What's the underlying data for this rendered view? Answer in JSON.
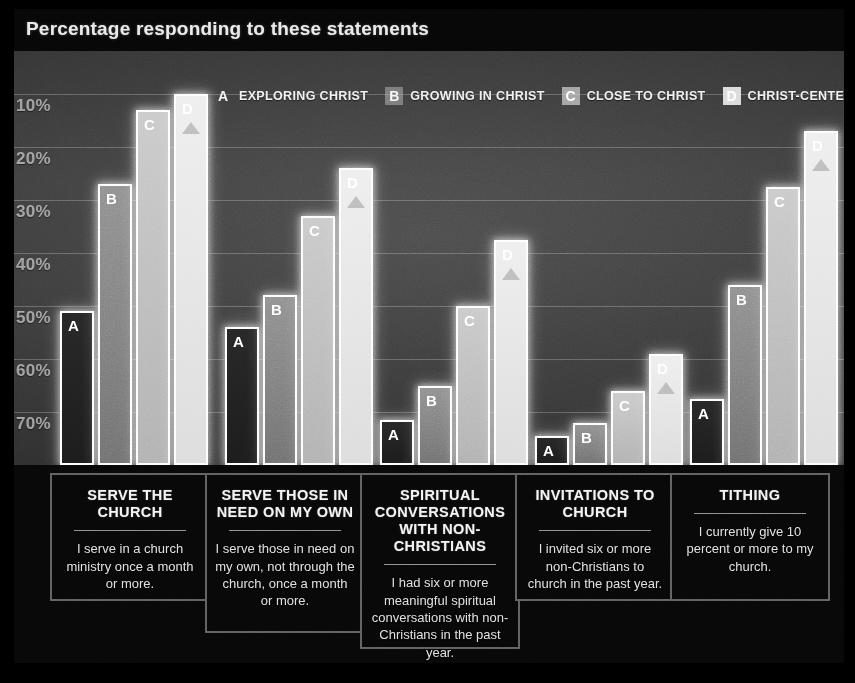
{
  "title": "Percentage responding to these statements",
  "legend": [
    {
      "badge": "A",
      "label": "EXPLORING CHRIST"
    },
    {
      "badge": "B",
      "label": "GROWING IN CHRIST"
    },
    {
      "badge": "C",
      "label": "CLOSE TO CHRIST"
    },
    {
      "badge": "D",
      "label": "CHRIST-CENTERED"
    }
  ],
  "yticks": [
    "70%",
    "60%",
    "50%",
    "40%",
    "30%",
    "20%",
    "10%"
  ],
  "cards": [
    {
      "heading": "SERVE THE CHURCH",
      "body": "I serve in a church ministry once a month or more."
    },
    {
      "heading": "SERVE THOSE IN NEED ON MY OWN",
      "body": "I serve those in need on my own, not through the church, once a month or more."
    },
    {
      "heading": "SPIRITUAL CONVERSATIONS WITH NON-CHRISTIANS",
      "body": "I had six or more meaningful spiritual conversations with non-Christians in the past year."
    },
    {
      "heading": "INVITATIONS TO CHURCH",
      "body": "I invited six or more non-Christians to church in the past year."
    },
    {
      "heading": "TITHING",
      "body": "I currently give 10 percent or more to my church."
    }
  ],
  "chart_data": {
    "type": "bar",
    "title": "Percentage responding to these statements",
    "xlabel": "",
    "ylabel": "Percentage",
    "ylim": [
      0,
      70
    ],
    "yticks": [
      10,
      20,
      30,
      40,
      50,
      60,
      70
    ],
    "grid": true,
    "legend_position": "top",
    "categories": [
      "SERVE THE CHURCH",
      "SERVE THOSE IN NEED ON MY OWN",
      "SPIRITUAL CONVERSATIONS WITH NON-CHRISTIANS",
      "INVITATIONS TO CHURCH",
      "TITHING"
    ],
    "series": [
      {
        "name": "A - EXPLORING CHRIST",
        "values": [
          29,
          26,
          8.5,
          5.5,
          12.5
        ]
      },
      {
        "name": "B - GROWING IN CHRIST",
        "values": [
          53,
          32,
          15,
          8,
          34
        ]
      },
      {
        "name": "C - CLOSE TO CHRIST",
        "values": [
          67,
          47,
          30,
          14,
          52.5
        ]
      },
      {
        "name": "D - CHRIST-CENTERED",
        "values": [
          70,
          56,
          42.5,
          21,
          63
        ]
      }
    ]
  }
}
